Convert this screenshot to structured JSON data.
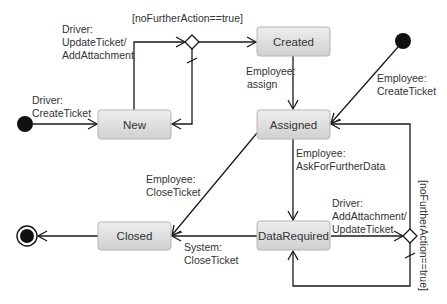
{
  "diagram": {
    "type": "uml-state-machine",
    "states": [
      {
        "id": "new",
        "label": "New"
      },
      {
        "id": "created",
        "label": "Created"
      },
      {
        "id": "assigned",
        "label": "Assigned"
      },
      {
        "id": "closed",
        "label": "Closed"
      },
      {
        "id": "datarequired",
        "label": "DataRequired"
      }
    ],
    "transitions": {
      "driver_create": {
        "line1": "Driver:",
        "line2": "CreateTicket"
      },
      "driver_update": {
        "line1": "Driver:",
        "line2": "UpdateTicket/",
        "line3": "AddAttachment"
      },
      "guard_top": "[noFurtherAction==true]",
      "employee_assign": {
        "line1": "Employee:",
        "line2": "assign"
      },
      "employee_create": {
        "line1": "Employee:",
        "line2": "CreateTicket"
      },
      "employee_ask": {
        "line1": "Employee:",
        "line2": "AskForFurtherData"
      },
      "employee_close": {
        "line1": "Employee:",
        "line2": "CloseTicket"
      },
      "system_close": {
        "line1": "System:",
        "line2": "CloseTicket"
      },
      "driver_add": {
        "line1": "Driver:",
        "line2": "AddAttachment/",
        "line3": "UpdateTicket"
      },
      "guard_right": "[noFurtherAction==true]"
    },
    "colors": {
      "state_fill_top": "#ececec",
      "state_fill_bottom": "#d2d2d2",
      "line": "#1a1a1a",
      "text": "#333333"
    }
  }
}
